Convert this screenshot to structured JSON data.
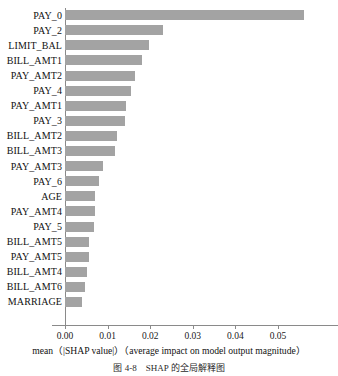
{
  "chart_data": {
    "type": "bar",
    "orientation": "horizontal",
    "title": "",
    "xlabel": "mean（|SHAP value|）（average impact on model output magnitude）",
    "ylabel": "",
    "xlim": [
      0.0,
      0.0642
    ],
    "grid": false,
    "legend": null,
    "bar_color": "#a3a3a3",
    "xticks": [
      "0.00",
      "0.01",
      "0.02",
      "0.03",
      "0.04",
      "0.05"
    ],
    "xtick_values": [
      0.0,
      0.01,
      0.02,
      0.03,
      0.04,
      0.05
    ],
    "categories": [
      "PAY_0",
      "PAY_2",
      "LIMIT_BAL",
      "BILL_AMT1",
      "PAY_AMT2",
      "PAY_4",
      "PAY_AMT1",
      "PAY_3",
      "BILL_AMT2",
      "BILL_AMT3",
      "PAY_AMT3",
      "PAY_6",
      "AGE",
      "PAY_AMT4",
      "PAY_5",
      "BILL_AMT5",
      "PAY_AMT5",
      "BILL_AMT4",
      "BILL_AMT6",
      "MARRIAGE"
    ],
    "values": [
      0.056,
      0.0231,
      0.0198,
      0.018,
      0.0164,
      0.0155,
      0.0144,
      0.0142,
      0.0122,
      0.0117,
      0.009,
      0.0079,
      0.0071,
      0.0071,
      0.0067,
      0.0057,
      0.0056,
      0.0052,
      0.0047,
      0.004
    ]
  },
  "caption": "图 4-8　SHAP 的全局解释图"
}
